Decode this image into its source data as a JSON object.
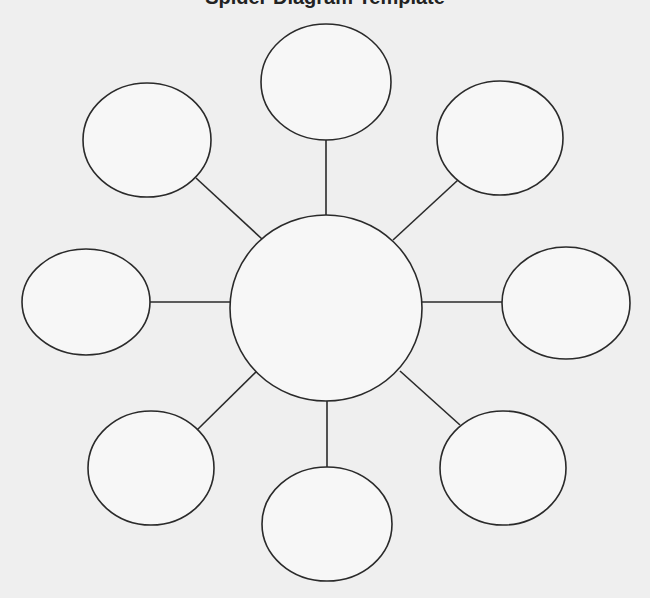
{
  "title": "Spider Diagram Template",
  "colors": {
    "background": "#efefef",
    "shape_fill": "#f7f7f7",
    "stroke": "#2a2a2a"
  },
  "center": {
    "cx": 326,
    "cy": 308,
    "rx": 96,
    "ry": 93,
    "label": ""
  },
  "nodes": [
    {
      "id": "top",
      "cx": 326,
      "cy": 82,
      "rx": 65,
      "ry": 58,
      "label": "",
      "line": [
        326,
        140,
        326,
        215
      ]
    },
    {
      "id": "top-right",
      "cx": 500,
      "cy": 138,
      "rx": 63,
      "ry": 57,
      "label": "",
      "line": [
        458,
        180,
        393,
        240
      ]
    },
    {
      "id": "right",
      "cx": 566,
      "cy": 303,
      "rx": 64,
      "ry": 56,
      "label": "",
      "line": [
        502,
        302,
        422,
        302
      ]
    },
    {
      "id": "bottom-right",
      "cx": 503,
      "cy": 468,
      "rx": 63,
      "ry": 57,
      "label": "",
      "line": [
        460,
        425,
        400,
        371
      ]
    },
    {
      "id": "bottom",
      "cx": 327,
      "cy": 524,
      "rx": 65,
      "ry": 57,
      "label": "",
      "line": [
        327,
        467,
        327,
        401
      ]
    },
    {
      "id": "bottom-left",
      "cx": 151,
      "cy": 468,
      "rx": 63,
      "ry": 57,
      "label": "",
      "line": [
        197,
        430,
        257,
        371
      ]
    },
    {
      "id": "left",
      "cx": 86,
      "cy": 302,
      "rx": 64,
      "ry": 53,
      "label": "",
      "line": [
        150,
        302,
        230,
        302
      ]
    },
    {
      "id": "top-left",
      "cx": 147,
      "cy": 140,
      "rx": 64,
      "ry": 57,
      "label": "",
      "line": [
        196,
        178,
        262,
        239
      ]
    }
  ]
}
